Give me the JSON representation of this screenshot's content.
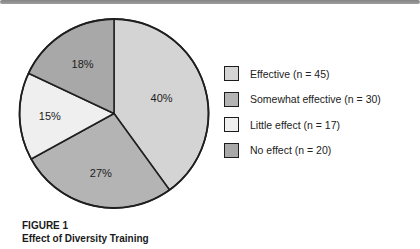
{
  "figure": {
    "caption_label": "FIGURE 1",
    "caption_title": "Effect of Diversity Training"
  },
  "chart_data": {
    "type": "pie",
    "title": "Effect of Diversity Training",
    "start_angle_deg": 0,
    "direction": "clockwise",
    "legend_position": "right",
    "stroke_color": "#1f1f1f",
    "slices": [
      {
        "label": "Effective",
        "n": 45,
        "percent": 40,
        "percent_label": "40%",
        "legend_label": "Effective (n = 45)",
        "color": "#d4d4d4"
      },
      {
        "label": "Somewhat effective",
        "n": 30,
        "percent": 27,
        "percent_label": "27%",
        "legend_label": "Somewhat effective (n = 30)",
        "color": "#b4b4b4"
      },
      {
        "label": "Little effect",
        "n": 17,
        "percent": 15,
        "percent_label": "15%",
        "legend_label": "Little effect (n = 17)",
        "color": "#efefef"
      },
      {
        "label": "No effect",
        "n": 20,
        "percent": 18,
        "percent_label": "18%",
        "legend_label": "No effect (n = 20)",
        "color": "#a8a8a8"
      }
    ]
  }
}
